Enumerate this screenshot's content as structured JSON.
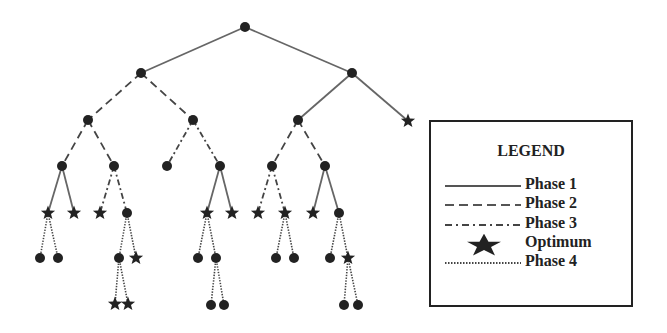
{
  "legend": {
    "title": "LEGEND",
    "items": [
      {
        "label": "Phase 1",
        "style": "solid"
      },
      {
        "label": "Phase 2",
        "style": "dashed"
      },
      {
        "label": "Phase 3",
        "style": "dashdot"
      },
      {
        "label": "Optimum",
        "style": "star"
      },
      {
        "label": "Phase 4",
        "style": "dotted"
      }
    ]
  },
  "colors": {
    "ink": "#222222",
    "edge": "#555555"
  },
  "tree": {
    "nodes": [
      {
        "id": "n0",
        "x": 245,
        "y": 27,
        "type": "node"
      },
      {
        "id": "n1",
        "x": 141,
        "y": 73,
        "type": "node"
      },
      {
        "id": "n2",
        "x": 352,
        "y": 73,
        "type": "node"
      },
      {
        "id": "n3",
        "x": 88,
        "y": 120,
        "type": "node"
      },
      {
        "id": "n4",
        "x": 193,
        "y": 120,
        "type": "node"
      },
      {
        "id": "n5",
        "x": 298,
        "y": 120,
        "type": "node"
      },
      {
        "id": "n6",
        "x": 408,
        "y": 121,
        "type": "star"
      },
      {
        "id": "n7",
        "x": 62,
        "y": 166,
        "type": "node"
      },
      {
        "id": "n8",
        "x": 114,
        "y": 166,
        "type": "node"
      },
      {
        "id": "n9",
        "x": 167,
        "y": 166,
        "type": "node"
      },
      {
        "id": "n10",
        "x": 220,
        "y": 166,
        "type": "node"
      },
      {
        "id": "n11",
        "x": 272,
        "y": 166,
        "type": "node"
      },
      {
        "id": "n12",
        "x": 325,
        "y": 166,
        "type": "node"
      },
      {
        "id": "n13",
        "x": 48,
        "y": 213,
        "type": "star"
      },
      {
        "id": "n14",
        "x": 74,
        "y": 213,
        "type": "star"
      },
      {
        "id": "n15",
        "x": 100,
        "y": 213,
        "type": "star"
      },
      {
        "id": "n16",
        "x": 127,
        "y": 213,
        "type": "node"
      },
      {
        "id": "n17",
        "x": 207,
        "y": 213,
        "type": "star"
      },
      {
        "id": "n18",
        "x": 232,
        "y": 213,
        "type": "star"
      },
      {
        "id": "n19",
        "x": 258,
        "y": 213,
        "type": "star"
      },
      {
        "id": "n20",
        "x": 285,
        "y": 213,
        "type": "star"
      },
      {
        "id": "n21",
        "x": 313,
        "y": 213,
        "type": "star"
      },
      {
        "id": "n22",
        "x": 339,
        "y": 213,
        "type": "node"
      },
      {
        "id": "n23",
        "x": 40,
        "y": 258,
        "type": "node"
      },
      {
        "id": "n24",
        "x": 58,
        "y": 258,
        "type": "node"
      },
      {
        "id": "n25",
        "x": 119,
        "y": 258,
        "type": "node"
      },
      {
        "id": "n26",
        "x": 136,
        "y": 258,
        "type": "star"
      },
      {
        "id": "n27",
        "x": 198,
        "y": 258,
        "type": "node"
      },
      {
        "id": "n28",
        "x": 216,
        "y": 258,
        "type": "node"
      },
      {
        "id": "n29",
        "x": 276,
        "y": 258,
        "type": "node"
      },
      {
        "id": "n30",
        "x": 294,
        "y": 258,
        "type": "node"
      },
      {
        "id": "n31",
        "x": 330,
        "y": 258,
        "type": "node"
      },
      {
        "id": "n32",
        "x": 348,
        "y": 258,
        "type": "star"
      },
      {
        "id": "n33",
        "x": 115,
        "y": 304,
        "type": "star"
      },
      {
        "id": "n34",
        "x": 128,
        "y": 304,
        "type": "star"
      },
      {
        "id": "n35",
        "x": 211,
        "y": 305,
        "type": "node"
      },
      {
        "id": "n36",
        "x": 224,
        "y": 305,
        "type": "node"
      },
      {
        "id": "n37",
        "x": 344,
        "y": 305,
        "type": "node"
      },
      {
        "id": "n38",
        "x": 358,
        "y": 305,
        "type": "node"
      }
    ],
    "edges": [
      {
        "from": "n0",
        "to": "n1",
        "phase": 1
      },
      {
        "from": "n0",
        "to": "n2",
        "phase": 1
      },
      {
        "from": "n1",
        "to": "n3",
        "phase": 2
      },
      {
        "from": "n1",
        "to": "n4",
        "phase": 2
      },
      {
        "from": "n2",
        "to": "n5",
        "phase": 1
      },
      {
        "from": "n2",
        "to": "n6",
        "phase": 1
      },
      {
        "from": "n3",
        "to": "n7",
        "phase": 2
      },
      {
        "from": "n3",
        "to": "n8",
        "phase": 2
      },
      {
        "from": "n4",
        "to": "n9",
        "phase": 3
      },
      {
        "from": "n4",
        "to": "n10",
        "phase": 3
      },
      {
        "from": "n5",
        "to": "n11",
        "phase": 2
      },
      {
        "from": "n5",
        "to": "n12",
        "phase": 2
      },
      {
        "from": "n7",
        "to": "n13",
        "phase": 1
      },
      {
        "from": "n7",
        "to": "n14",
        "phase": 1
      },
      {
        "from": "n8",
        "to": "n15",
        "phase": 3
      },
      {
        "from": "n8",
        "to": "n16",
        "phase": 3
      },
      {
        "from": "n10",
        "to": "n17",
        "phase": 1
      },
      {
        "from": "n10",
        "to": "n18",
        "phase": 1
      },
      {
        "from": "n11",
        "to": "n19",
        "phase": 3
      },
      {
        "from": "n11",
        "to": "n20",
        "phase": 3
      },
      {
        "from": "n12",
        "to": "n21",
        "phase": 1
      },
      {
        "from": "n12",
        "to": "n22",
        "phase": 1
      },
      {
        "from": "n13",
        "to": "n23",
        "phase": 4
      },
      {
        "from": "n13",
        "to": "n24",
        "phase": 4
      },
      {
        "from": "n16",
        "to": "n25",
        "phase": 4
      },
      {
        "from": "n16",
        "to": "n26",
        "phase": 4
      },
      {
        "from": "n17",
        "to": "n27",
        "phase": 4
      },
      {
        "from": "n17",
        "to": "n28",
        "phase": 4
      },
      {
        "from": "n20",
        "to": "n29",
        "phase": 4
      },
      {
        "from": "n20",
        "to": "n30",
        "phase": 4
      },
      {
        "from": "n22",
        "to": "n31",
        "phase": 4
      },
      {
        "from": "n22",
        "to": "n32",
        "phase": 4
      },
      {
        "from": "n25",
        "to": "n33",
        "phase": 4
      },
      {
        "from": "n25",
        "to": "n34",
        "phase": 4
      },
      {
        "from": "n28",
        "to": "n35",
        "phase": 4
      },
      {
        "from": "n28",
        "to": "n36",
        "phase": 4
      },
      {
        "from": "n32",
        "to": "n37",
        "phase": 4
      },
      {
        "from": "n32",
        "to": "n38",
        "phase": 4
      }
    ]
  }
}
